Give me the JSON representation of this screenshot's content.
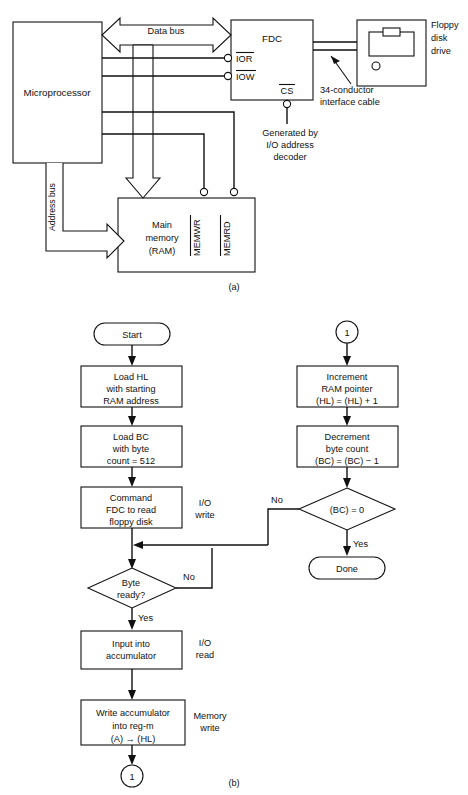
{
  "figure": {
    "part_a_label": "(a)",
    "part_b_label": "(b)"
  },
  "block_diagram": {
    "blocks": {
      "microprocessor": "Microprocessor",
      "fdc": "FDC",
      "main_memory_line1": "Main",
      "main_memory_line2": "memory",
      "main_memory_line3": "(RAM)",
      "floppy_line1": "Floppy",
      "floppy_line2": "disk",
      "floppy_line3": "drive"
    },
    "buses": {
      "data_bus": "Data bus",
      "address_bus": "Address bus"
    },
    "signals": {
      "ior": "IOR",
      "iow": "IOW",
      "cs": "CS",
      "memwr": "MEMWR",
      "memrd": "MEMRD"
    },
    "annotations": {
      "cable_line1": "34-conductor",
      "cable_line2": "interface cable",
      "cs_note_line1": "Generated by",
      "cs_note_line2": "I/O address",
      "cs_note_line3": "decoder"
    }
  },
  "flowchart": {
    "start": "Start",
    "done": "Done",
    "connector": "1",
    "nodes": {
      "load_hl": [
        "Load HL",
        "with starting",
        "RAM address"
      ],
      "load_bc": [
        "Load BC",
        "with byte",
        "count = 512"
      ],
      "command_fdc": [
        "Command",
        "FDC to read",
        "floppy disk"
      ],
      "byte_ready": [
        "Byte",
        "ready?"
      ],
      "input_acc": [
        "Input into",
        "accumulator"
      ],
      "write_acc": [
        "Write accumulator",
        "into reg-m",
        "(A) → (HL)"
      ],
      "increment": [
        "Increment",
        "RAM pointer",
        "(HL) = (HL) + 1"
      ],
      "decrement": [
        "Decrement",
        "byte count",
        "(BC) = (BC) − 1"
      ],
      "bc_zero": [
        "(BC) = 0"
      ]
    },
    "side_labels": {
      "io_write": [
        "I/O",
        "write"
      ],
      "io_read": [
        "I/O",
        "read"
      ],
      "memory_write": [
        "Memory",
        "write"
      ]
    },
    "branches": {
      "no": "No",
      "yes": "Yes",
      "no2": "No",
      "yes2": "Yes"
    }
  },
  "colors": {
    "ink": "#111111",
    "paper": "#ffffff"
  }
}
